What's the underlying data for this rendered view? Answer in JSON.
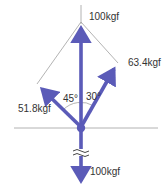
{
  "diagram": {
    "type": "force-vector-diagram",
    "colors": {
      "vector": "#5b5bb8",
      "guide": "#9a9a9a",
      "text": "#333333",
      "background": "#ffffff"
    },
    "labels": {
      "up_force": "100kgf",
      "right_force": "63.4kgf",
      "left_force": "51.8kgf",
      "down_force": "100kgf",
      "left_angle": "45°",
      "right_angle": "30°"
    },
    "forces": [
      {
        "name": "resultant-up",
        "magnitude": "100kgf",
        "direction_deg_from_vertical": 0
      },
      {
        "name": "left",
        "magnitude": "51.8kgf",
        "direction_deg_from_vertical": -45
      },
      {
        "name": "right",
        "magnitude": "63.4kgf",
        "direction_deg_from_vertical": 30
      },
      {
        "name": "load-down",
        "magnitude": "100kgf",
        "direction_deg_from_vertical": 180
      }
    ],
    "break_symbol": "≈"
  }
}
